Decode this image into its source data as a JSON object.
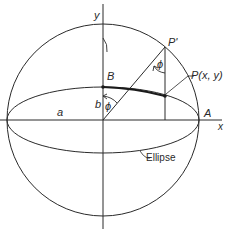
{
  "diagram": {
    "type": "geometric construction",
    "labels": {
      "y_axis": "y",
      "x_axis": "x",
      "point_B": "B",
      "point_P_prime": "P'",
      "point_P": "P(x, y)",
      "point_A": "A",
      "semi_major": "a",
      "semi_minor": "b",
      "angle_top": "ϕ",
      "angle_center": "ϕ",
      "ellipse_label": "Ellipse"
    },
    "colors": {
      "stroke": "#2a2a2a",
      "background": "#ffffff"
    }
  }
}
